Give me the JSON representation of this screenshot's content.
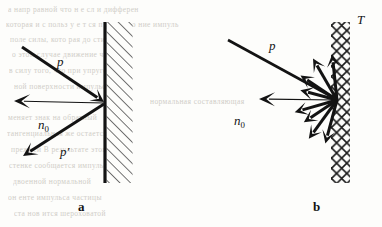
{
  "figure": {
    "type": "physics-diagram",
    "background_color": "#fdfdfb",
    "ink_color": "#131313"
  },
  "panels": [
    {
      "id": "a",
      "caption": "a",
      "caption_pos": {
        "x": 78,
        "y": 199
      },
      "kind": "specular-reflection",
      "wall": {
        "kind": "smooth-hatched-wall",
        "x": 105,
        "y_top": 22,
        "y_bottom": 183,
        "line_width": 3.2,
        "hatch_width": 26,
        "hatch_direction": "lower-left-to-upper-right",
        "hatch_spacing": 7.5,
        "hatch_width_px": 1.3
      },
      "impact_point": {
        "x": 105,
        "y": 103
      },
      "vectors": [
        {
          "name": "incident-momentum",
          "label": "p",
          "label_pos": {
            "x": 57,
            "y": 54
          },
          "from": {
            "x": 22,
            "y": 47
          },
          "to": {
            "x": 104,
            "y": 102
          },
          "thickness": 3.0,
          "head": "solid-barbed",
          "head_len": 13,
          "head_wid": 7
        },
        {
          "name": "reflected-momentum",
          "label": "p′",
          "label_pos": {
            "x": 60,
            "y": 144
          },
          "from": {
            "x": 104,
            "y": 104
          },
          "to": {
            "x": 23,
            "y": 156
          },
          "thickness": 3.0,
          "head": "solid-barbed",
          "head_len": 14,
          "head_wid": 7
        },
        {
          "name": "surface-normal",
          "label": "n",
          "label_sub": "0",
          "label_pos": {
            "x": 38,
            "y": 117
          },
          "from": {
            "x": 104,
            "y": 103
          },
          "to": {
            "x": 14,
            "y": 101
          },
          "thickness": 1.1,
          "head": "solid-barbed",
          "head_len": 16,
          "head_wid": 7
        }
      ]
    },
    {
      "id": "b",
      "caption": "b",
      "caption_pos": {
        "x": 313,
        "y": 199
      },
      "kind": "diffuse-scattering",
      "wall": {
        "kind": "rough-crosshatched-wall",
        "x_left": 331,
        "x_right": 350,
        "y_top": 22,
        "y_bottom": 183,
        "cell": 10.2,
        "line_width": 1.6,
        "label": "T",
        "label_pos": {
          "x": 357,
          "y": 12
        }
      },
      "impact_point": {
        "x": 337,
        "y": 100
      },
      "vectors": [
        {
          "name": "incident-momentum",
          "label": "p",
          "label_pos": {
            "x": 269,
            "y": 38
          },
          "from": {
            "x": 228,
            "y": 40
          },
          "to": {
            "x": 336,
            "y": 99
          },
          "thickness": 2.6,
          "head": "none"
        },
        {
          "name": "surface-normal",
          "label": "n",
          "label_sub": "0",
          "label_pos": {
            "x": 234,
            "y": 113
          },
          "from": {
            "x": 336,
            "y": 100
          },
          "to": {
            "x": 259,
            "y": 99
          },
          "thickness": 1.1,
          "head": "solid-barbed",
          "head_len": 16,
          "head_wid": 7
        }
      ],
      "scatter_rays": [
        {
          "name": "scatter-ray-1",
          "angle_deg": 255,
          "length": 45,
          "thickness": 3.0
        },
        {
          "name": "scatter-ray-2",
          "angle_deg": 234,
          "length": 48,
          "thickness": 3.0
        },
        {
          "name": "scatter-ray-3",
          "angle_deg": 214,
          "length": 40,
          "thickness": 3.0
        },
        {
          "name": "scatter-ray-4",
          "angle_deg": 196,
          "length": 44,
          "thickness": 3.0
        },
        {
          "name": "scatter-ray-5",
          "angle_deg": 165,
          "length": 38,
          "thickness": 3.0
        },
        {
          "name": "scatter-ray-6",
          "angle_deg": 146,
          "length": 44,
          "thickness": 3.0
        },
        {
          "name": "scatter-ray-7",
          "angle_deg": 120,
          "length": 48,
          "thickness": 3.0
        },
        {
          "name": "scatter-ray-8",
          "angle_deg": 96,
          "length": 46,
          "thickness": 3.0
        }
      ]
    }
  ],
  "ghost_text": {
    "note": "faint show-through text from the reverse side of the scanned page",
    "lines": [
      {
        "text": "а     напр     равной        что      н е сл и      дифферен",
        "x": 8,
        "y": 5
      },
      {
        "text": "которая     и с польз у е т ся        п р и   помо   ние импуль",
        "x": 6,
        "y": 20
      },
      {
        "text": "поле      силы,  кото  рая   до      стигае тся",
        "x": 10,
        "y": 35
      },
      {
        "text": "о     этом      случае        движение      частиц",
        "x": 12,
        "y": 50
      },
      {
        "text": "в   силу   того,     что    при    упругом",
        "x": 9,
        "y": 66
      },
      {
        "text": "ной   поверхности      импульс   части",
        "x": 14,
        "y": 82
      },
      {
        "text": "нормальная        составляющая",
        "x": 150,
        "y": 97
      },
      {
        "text": "меняет      знак    на     обратный",
        "x": 8,
        "y": 113
      },
      {
        "text": "тангенциальная     же     остается",
        "x": 7,
        "y": 129
      },
      {
        "text": "прежней    В     результате     этого",
        "x": 11,
        "y": 145
      },
      {
        "text": "стенке    сообщается     импульс",
        "x": 9,
        "y": 161
      },
      {
        "text": "двоенной     нормальной",
        "x": 13,
        "y": 177
      },
      {
        "text": "он    енте     импульса      частицы",
        "x": 8,
        "y": 193
      },
      {
        "text": "ста     нов    ится      шероховатой",
        "x": 14,
        "y": 209
      }
    ]
  }
}
